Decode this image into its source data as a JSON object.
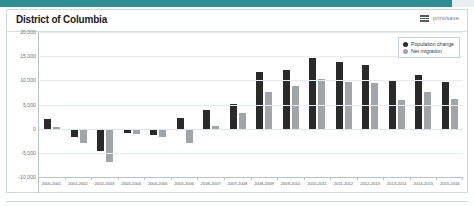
{
  "header": {
    "title": "District of Columbia",
    "print_save_label": "print/save",
    "menu_icon": "hamburger-icon"
  },
  "legend": {
    "position": "top-right",
    "items": [
      {
        "label": "Population change",
        "color": "#2a2a2a",
        "marker": "circle"
      },
      {
        "label": "Net migration",
        "color": "#a0a5a8",
        "marker": "circle"
      }
    ]
  },
  "chart_data": {
    "type": "bar",
    "title": "District of Columbia",
    "xlabel": "",
    "ylabel": "",
    "ylim": [
      -10000,
      20000
    ],
    "yticks": [
      20000,
      15000,
      10000,
      5000,
      0,
      -5000,
      -10000
    ],
    "ytick_labels": [
      "20,000",
      "15,000",
      "10,000",
      "5,000",
      "0",
      "-5,000",
      "-10,000"
    ],
    "grid": true,
    "legend_position": "top-right",
    "categories": [
      "2000-2001",
      "2001-2002",
      "2002-2003",
      "2003-2004",
      "2004-2005",
      "2005-2006",
      "2006-2007",
      "2007-2008",
      "2008-2009",
      "2009-2010",
      "2010-2011",
      "2011-2012",
      "2012-2013",
      "2013-2014",
      "2014-2015",
      "2015-2016"
    ],
    "series": [
      {
        "name": "Population change",
        "color": "#2a2a2a",
        "values": [
          2000,
          -1700,
          -4700,
          -1000,
          -1400,
          2200,
          3800,
          5200,
          11800,
          12200,
          14600,
          13700,
          13200,
          9800,
          11200,
          9700
        ]
      },
      {
        "name": "Net migration",
        "color": "#a0a5a8",
        "values": [
          300,
          -3000,
          -7000,
          -1200,
          -1700,
          -2900,
          600,
          3200,
          7600,
          8800,
          10300,
          9700,
          9400,
          5900,
          7600,
          6100
        ]
      }
    ]
  }
}
